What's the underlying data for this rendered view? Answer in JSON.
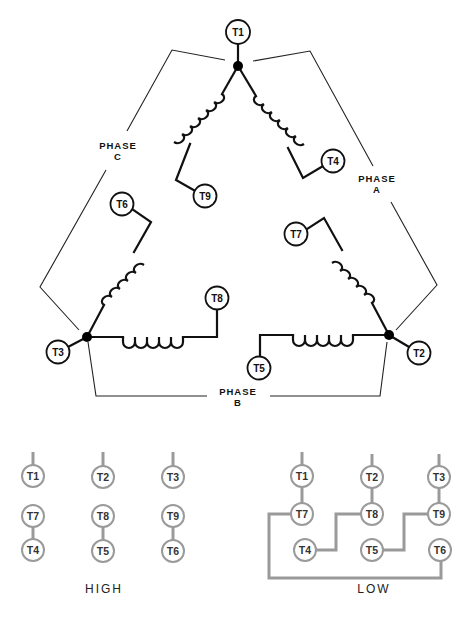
{
  "diagram": {
    "phases": {
      "a": {
        "line1": "PHASE",
        "line2": "A"
      },
      "b": {
        "line1": "PHASE",
        "line2": "B"
      },
      "c": {
        "line1": "PHASE",
        "line2": "C"
      }
    },
    "terminals": {
      "t1": "T1",
      "t2": "T2",
      "t3": "T3",
      "t4": "T4",
      "t5": "T5",
      "t6": "T6",
      "t7": "T7",
      "t8": "T8",
      "t9": "T9"
    },
    "connections": {
      "high": {
        "label": "HIGH",
        "rows": [
          [
            "T1",
            "T2",
            "T3"
          ],
          [
            "T7",
            "T8",
            "T9"
          ],
          [
            "T4",
            "T5",
            "T6"
          ]
        ],
        "links": [
          [
            "T7",
            "T4"
          ],
          [
            "T8",
            "T5"
          ],
          [
            "T9",
            "T6"
          ]
        ]
      },
      "low": {
        "label": "LOW",
        "rows": [
          [
            "T1",
            "T2",
            "T3"
          ],
          [
            "T7",
            "T8",
            "T9"
          ],
          [
            "T4",
            "T5",
            "T6"
          ]
        ],
        "links": [
          [
            "T1",
            "T7"
          ],
          [
            "T2",
            "T8"
          ],
          [
            "T3",
            "T9"
          ],
          [
            "T4",
            "T8"
          ],
          [
            "T5",
            "T9"
          ],
          [
            "T7",
            "T6"
          ]
        ]
      }
    },
    "colors": {
      "line": "#111111",
      "connection_gray": "#9a9a9a",
      "background": "#ffffff"
    }
  }
}
